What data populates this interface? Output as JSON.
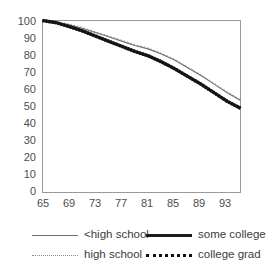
{
  "chart_data": {
    "type": "line",
    "title": "",
    "xlabel": "",
    "ylabel": "",
    "xlim": [
      65,
      95
    ],
    "ylim": [
      0,
      100
    ],
    "grid": false,
    "legend_position": "bottom",
    "xticks": [
      65,
      69,
      73,
      77,
      81,
      85,
      89,
      93
    ],
    "yticks": [
      0,
      10,
      20,
      30,
      40,
      50,
      60,
      70,
      80,
      90,
      100
    ],
    "x": [
      65,
      67,
      69,
      71,
      73,
      75,
      77,
      79,
      81,
      83,
      85,
      87,
      89,
      91,
      93,
      95
    ],
    "series": [
      {
        "name": "<high school",
        "style": "thin-solid",
        "color": "#6e6e6e",
        "values": [
          100,
          99,
          97.5,
          95.5,
          93,
          90.5,
          88,
          85.5,
          83.5,
          80.5,
          77,
          72.5,
          68,
          63,
          58,
          53.5
        ]
      },
      {
        "name": "high school",
        "style": "fine-dotted",
        "color": "#8a8a8a",
        "values": [
          100,
          99.2,
          98,
          96,
          93.5,
          91,
          88.5,
          86,
          84,
          81,
          77.5,
          73,
          68.5,
          63.5,
          58.5,
          54
        ]
      },
      {
        "name": "some college",
        "style": "thick-solid",
        "color": "#1a1a1a",
        "values": [
          100,
          98.8,
          96.5,
          94,
          91,
          88,
          85,
          82,
          79.5,
          76,
          72,
          67.5,
          63,
          58,
          53,
          49
        ]
      },
      {
        "name": "college grad",
        "style": "thick-dotted",
        "color": "#111111",
        "values": [
          100,
          98.8,
          96.5,
          94,
          91,
          88,
          85,
          82,
          79.5,
          76,
          72,
          67.5,
          63,
          58,
          53,
          49
        ]
      }
    ]
  },
  "legend": {
    "entries": [
      {
        "label": "<high school"
      },
      {
        "label": "some college"
      },
      {
        "label": "high school"
      },
      {
        "label": "college grad"
      }
    ]
  },
  "axis": {
    "y_labels": [
      "100",
      "90",
      "80",
      "70",
      "60",
      "50",
      "40",
      "30",
      "20",
      "10",
      "0"
    ],
    "x_labels": [
      "65",
      "69",
      "73",
      "77",
      "81",
      "85",
      "89",
      "93"
    ]
  }
}
